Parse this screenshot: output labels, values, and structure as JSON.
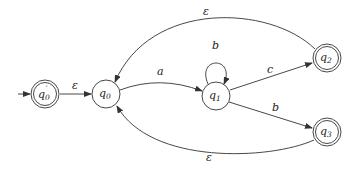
{
  "diagram": {
    "type": "finite-automaton",
    "colors": {
      "stroke": "#333333",
      "text": "#222222",
      "background": "#ffffff"
    },
    "states": [
      {
        "id": "q0p",
        "base": "q",
        "sub": "0",
        "prime": "′",
        "label": "q0'",
        "accepting": true,
        "initial": true,
        "x": 45,
        "y": 94
      },
      {
        "id": "q0",
        "base": "q",
        "sub": "0",
        "prime": "",
        "label": "q0",
        "accepting": false,
        "initial": false,
        "x": 106,
        "y": 94
      },
      {
        "id": "q1",
        "base": "q",
        "sub": "1",
        "prime": "",
        "label": "q1",
        "accepting": false,
        "initial": false,
        "x": 216,
        "y": 96
      },
      {
        "id": "q2",
        "base": "q",
        "sub": "2",
        "prime": "",
        "label": "q2",
        "accepting": true,
        "initial": false,
        "x": 327,
        "y": 58
      },
      {
        "id": "q3",
        "base": "q",
        "sub": "3",
        "prime": "",
        "label": "q3",
        "accepting": true,
        "initial": false,
        "x": 327,
        "y": 132
      }
    ],
    "transitions": [
      {
        "from": "q0p",
        "to": "q0",
        "label": "ε"
      },
      {
        "from": "q0",
        "to": "q1",
        "label": "a"
      },
      {
        "from": "q1",
        "to": "q1",
        "label": "b"
      },
      {
        "from": "q1",
        "to": "q2",
        "label": "c"
      },
      {
        "from": "q1",
        "to": "q3",
        "label": "b"
      },
      {
        "from": "q2",
        "to": "q0",
        "label": "ε"
      },
      {
        "from": "q3",
        "to": "q0",
        "label": "ε"
      }
    ]
  }
}
